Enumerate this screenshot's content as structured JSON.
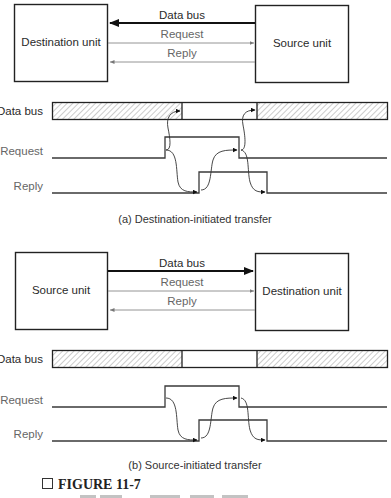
{
  "diagram_a": {
    "left_unit": "Destination unit",
    "right_unit": "Source unit",
    "lines": {
      "data_bus": "Data bus",
      "request": "Request",
      "reply": "Reply"
    },
    "data_bus_direction": "right-to-left",
    "timing": {
      "rows": [
        "Data bus",
        "Request",
        "Reply"
      ]
    },
    "caption": "(a) Destination-initiated transfer"
  },
  "diagram_b": {
    "left_unit": "Source unit",
    "right_unit": "Destination unit",
    "lines": {
      "data_bus": "Data bus",
      "request": "Request",
      "reply": "Reply"
    },
    "data_bus_direction": "left-to-right",
    "timing": {
      "rows": [
        "Data bus",
        "Request",
        "Reply"
      ]
    },
    "caption": "(b) Source-initiated transfer"
  },
  "figure": {
    "checkbox_glyph": "□",
    "label": "FIGURE 11-7"
  }
}
